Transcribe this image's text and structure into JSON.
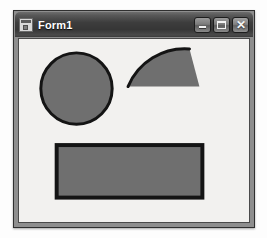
{
  "window": {
    "title": "Form1",
    "icon": "form-window-icon",
    "frame_color": "#8e8e8e",
    "titlebar_color": "#3d3d3d",
    "title_text_color": "#ffffff",
    "client_color": "#f2f1ef"
  },
  "controls": {
    "minimize": {
      "name": "minimize-button",
      "glyph": "minimize-icon",
      "label": "_"
    },
    "maximize": {
      "name": "maximize-button",
      "glyph": "maximize-icon",
      "label": "□"
    },
    "close": {
      "name": "close-button",
      "glyph": "close-icon",
      "label": "✕"
    }
  },
  "canvas": {
    "width": 232,
    "height": 185,
    "shapes": [
      {
        "name": "circle-shape",
        "type": "ellipse",
        "cx": 58,
        "cy": 50,
        "rx": 36,
        "ry": 36,
        "fill": "#6f6f6f",
        "stroke": "#141414",
        "stroke_width": 3
      },
      {
        "name": "pie-wedge-shape",
        "type": "pie",
        "path": "M 110 48 A 62 62 0 0 1 172 10 L 182 48 Z",
        "fill": "#6f6f6f",
        "stroke": "#141414",
        "stroke_width": 3,
        "arc_only": "M 110 48 A 62 62 0 0 1 172 10"
      },
      {
        "name": "rectangle-shape",
        "type": "rect",
        "x": 38,
        "y": 107,
        "width": 147,
        "height": 53,
        "fill": "#6f6f6f",
        "stroke": "#141414",
        "stroke_width": 4
      }
    ]
  }
}
